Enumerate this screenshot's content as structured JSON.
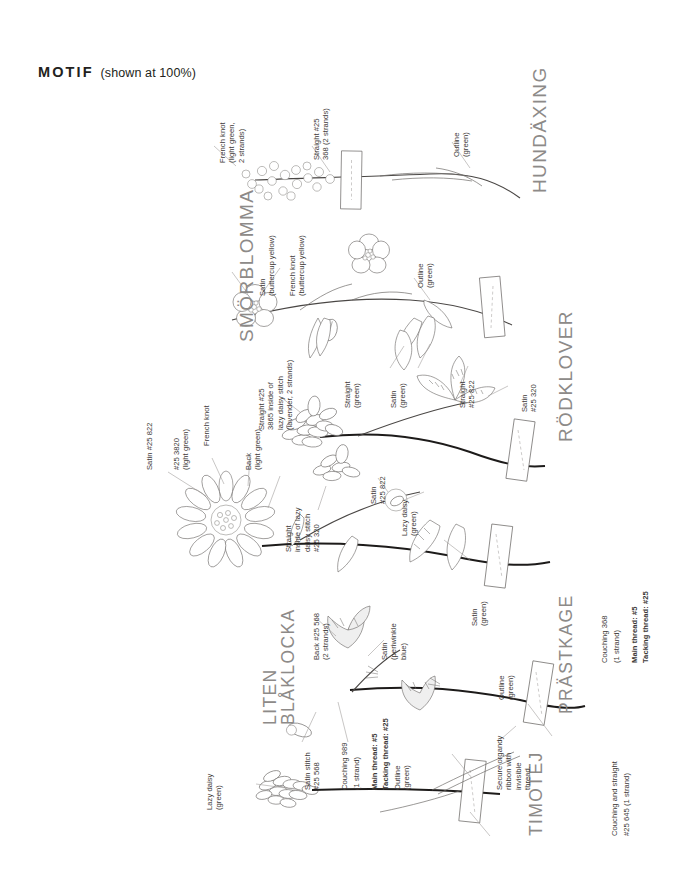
{
  "header": {
    "motif": "MOTIF",
    "shown_at": "(shown at 100%)"
  },
  "sections": [
    {
      "id": "hundaxing",
      "name": "HUNDÄXING",
      "labels": [
        "French knot\n(light green,\n2 strands)",
        "Straight #25\n368 (2 strands)",
        "Outline\n(green)"
      ]
    },
    {
      "id": "smorblomma",
      "name": "SMÖRBLOMMA",
      "labels": [
        "Satin\n(buttercup yellow)",
        "French knot\n(buttercup yellow)",
        "Outline\n(green)"
      ]
    },
    {
      "id": "rodklover",
      "name": "RÖDKLOVER",
      "labels": [
        "Straight #25\n3865 inside of\nlazy daisy stitch\n(lavender, 2 strands)",
        "Straight\n(green)",
        "Satin\n(green)",
        "Straight\n#25 822",
        "Satin\n#25 320"
      ]
    },
    {
      "id": "prastkage",
      "name": "PRÄSTKAGE",
      "labels": [
        "Satin #25 822",
        "#25 3820\n(light green)",
        "French knot",
        "Back\n(light green)",
        "Straight\ninside of lazy\ndaisy stitch\n#25 320",
        "Satin\n#25 822",
        "Lazy daisy\n(green)",
        "Satin\n(green)"
      ],
      "notes": [
        "Couching 368",
        "(1 strand)",
        "Main thread: #5",
        "Tacking thread: #25"
      ]
    },
    {
      "id": "liten-blaklocka",
      "name": "LITEN\nBLÅKLOCKA",
      "labels": [
        "Back #25 568\n(2 strands)",
        "Satin\n(periwinkle\nblue)",
        "Satin stitch\n#25 568",
        "Outline\n(green)",
        "Outline\n(green)"
      ],
      "notes": [
        "Couching 989",
        "(1 strand)",
        "Main thread: #5",
        "Tacking thread: #25"
      ]
    },
    {
      "id": "timotej",
      "name": "TIMOTEJ",
      "labels": [
        "Lazy daisy\n(green)",
        "Secure organdy\nribbon with\ninvisible\nthread."
      ],
      "notes": [
        "Couching and straight",
        "#25 645 (1 strand)"
      ]
    }
  ]
}
